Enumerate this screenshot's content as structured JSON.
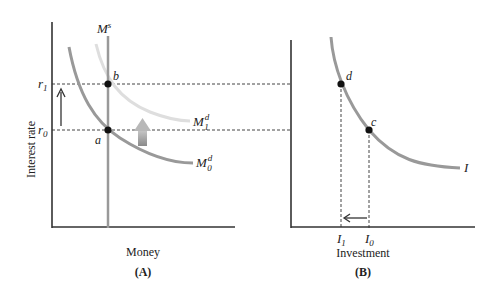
{
  "panel_a": {
    "caption": "(A)",
    "x_label": "Money",
    "y_label": "Interest rate",
    "supply_label": {
      "base": "M",
      "sup": "s"
    },
    "demand0_label": {
      "base": "M",
      "sup": "d",
      "sub": "0"
    },
    "demand1_label": {
      "base": "M",
      "sup": "d",
      "sub": "1"
    },
    "r1_label": {
      "base": "r",
      "sub": "1"
    },
    "r0_label": {
      "base": "r",
      "sub": "0"
    },
    "point_b": "b",
    "point_a": "a"
  },
  "panel_b": {
    "caption": "(B)",
    "x_label": "Investment",
    "curve_label": "I",
    "point_d": "d",
    "point_c": "c",
    "i1_label": {
      "base": "I",
      "sub": "1"
    },
    "i0_label": {
      "base": "I",
      "sub": "0"
    }
  },
  "colors": {
    "axis": "#333333",
    "curve": "#999999",
    "curve_shifted": "#dddddd",
    "supply": "#999999",
    "dot": "#111111",
    "dashes": "#444444",
    "shift_arrow": "#a0a0a0"
  }
}
